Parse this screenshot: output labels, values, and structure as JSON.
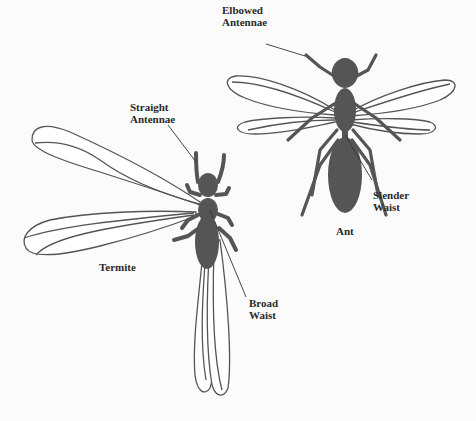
{
  "diagram": {
    "background": "#fbfbfb",
    "body_color": "#555555",
    "wing_outline_color": "#555555",
    "insects": {
      "ant": {
        "name": "Ant",
        "features": {
          "antennae": {
            "line1": "Elbowed",
            "line2": "Antennae"
          },
          "waist": {
            "line1": "Slender",
            "line2": "Waist"
          }
        }
      },
      "termite": {
        "name": "Termite",
        "features": {
          "antennae": {
            "line1": "Straight",
            "line2": "Antennae"
          },
          "waist": {
            "line1": "Broad",
            "line2": "Waist"
          }
        }
      }
    }
  }
}
